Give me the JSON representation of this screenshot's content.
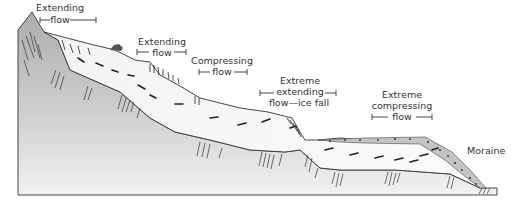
{
  "figure": {
    "type": "glacier-flow-cross-section",
    "colors": {
      "bedrock_top": "#b9b9b9",
      "bedrock_bottom": "#efefef",
      "ice": "#f7f7f7",
      "moraine": "#c9c9c9",
      "outline": "#333333",
      "text": "#333333"
    }
  },
  "labels": {
    "extending1": {
      "line1": "Extending",
      "line2": "flow"
    },
    "extending2": {
      "line1": "Extending",
      "line2": "flow"
    },
    "compressing": {
      "line1": "Compressing",
      "line2": "flow"
    },
    "extreme_extending": {
      "line1": "Extreme",
      "line2": "extending",
      "line3": "flow—ice fall"
    },
    "extreme_compressing": {
      "line1": "Extreme",
      "line2": "compressing",
      "line3": "flow"
    },
    "moraine": "Moraine"
  }
}
